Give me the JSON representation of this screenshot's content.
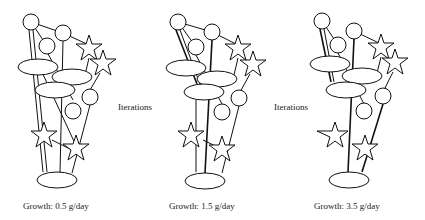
{
  "figures": [
    {
      "label": "Growth: 0.5 g/day"
    },
    {
      "label": "Growth: 1.5 g/day"
    },
    {
      "label": "Growth: 3.5 g/day"
    }
  ],
  "arrows": [
    {
      "label": "Iterations"
    },
    {
      "label": "Iterations"
    }
  ],
  "colors": {
    "stroke": "#111111",
    "fill": "#ffffff",
    "text": "#222222"
  }
}
